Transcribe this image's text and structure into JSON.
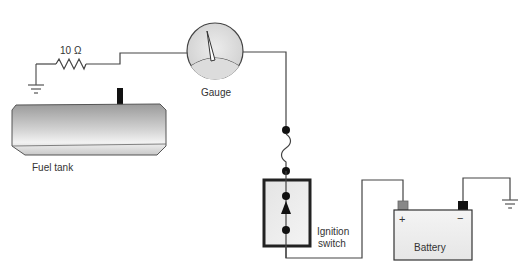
{
  "diagram": {
    "components": {
      "resistor": {
        "label": "10 Ω"
      },
      "gauge": {
        "label": "Gauge"
      },
      "fuel_tank": {
        "label": "Fuel tank"
      },
      "ignition_switch": {
        "label_line1": "Ignition",
        "label_line2": "switch"
      },
      "battery": {
        "label": "Battery",
        "positive": "+",
        "negative": "−"
      }
    },
    "colors": {
      "wire": "#444444",
      "component_fill": "#e8e8e8",
      "terminal_positive": "#888888",
      "terminal_negative": "#111111"
    }
  }
}
